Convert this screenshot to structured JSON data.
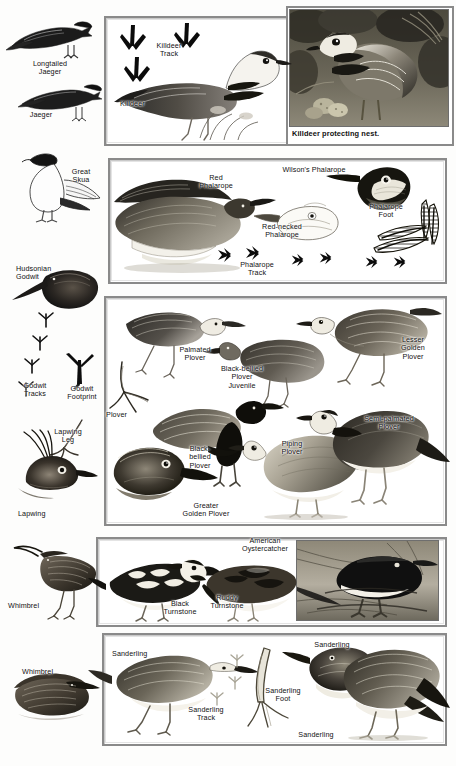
{
  "plate": {
    "title": "Shorebirds identification plate",
    "background_color": "#fdfdfc",
    "panel_border_color": "#8a8a8a",
    "label_color": "#111111"
  },
  "left_column": {
    "labels": [
      {
        "id": "longtailed-jaeger",
        "text": "Longtailed\nJaeger"
      },
      {
        "id": "jaeger",
        "text": "Jaeger"
      },
      {
        "id": "great-skua",
        "text": "Great\nSkua"
      },
      {
        "id": "hudsonian-godwit",
        "text": "Hudsonian\nGodwit"
      },
      {
        "id": "godwit-footprint",
        "text": "Godwit\nFootprint"
      },
      {
        "id": "godwit-tracks",
        "text": "Godwit\nTracks"
      },
      {
        "id": "lapwing-leg",
        "text": "Lapwing\nLeg"
      },
      {
        "id": "lapwing",
        "text": "Lapwing"
      },
      {
        "id": "whimbrel-standing",
        "text": "Whimbrel"
      },
      {
        "id": "whimbrel-sitting",
        "text": "Whimbrel"
      }
    ]
  },
  "panels": [
    {
      "id": "killdeer-panel",
      "labels": [
        {
          "id": "killdeer-track",
          "text": "Killdeer\nTrack"
        },
        {
          "id": "killdeer",
          "text": "Killdeer"
        }
      ]
    },
    {
      "id": "phalarope-panel",
      "labels": [
        {
          "id": "red-phalarope",
          "text": "Red\nPhalarope"
        },
        {
          "id": "wilsons-phalarope",
          "text": "Wilson's Phalarope"
        },
        {
          "id": "red-necked-phalarope",
          "text": "Red-necked\nPhalarope"
        },
        {
          "id": "phalarope-foot",
          "text": "Phalarope\nFoot"
        },
        {
          "id": "phalarope-track",
          "text": "Phalarope\nTrack"
        }
      ]
    },
    {
      "id": "plover-panel",
      "labels": [
        {
          "id": "palmated-plover",
          "text": "Palmated\nPlover"
        },
        {
          "id": "black-bellied-plover-juvenile",
          "text": "Black-bellied\nPlover\nJuvenile"
        },
        {
          "id": "lesser-golden-plover",
          "text": "Lesser\nGolden\nPlover"
        },
        {
          "id": "plover-foot",
          "text": "Plover"
        },
        {
          "id": "black-bellied-plover",
          "text": "Black-\nbellied\nPlover"
        },
        {
          "id": "piping-plover",
          "text": "Piping\nPlover"
        },
        {
          "id": "semi-palmated-plover",
          "text": "Semi-palmated\nPlover"
        },
        {
          "id": "greater-golden-plover",
          "text": "Greater\nGolden Plover"
        }
      ]
    },
    {
      "id": "turnstone-row",
      "labels": [
        {
          "id": "black-turnstone",
          "text": "Black\nTurnstone"
        },
        {
          "id": "ruddy-turnstone",
          "text": "Ruddy\nTurnstone"
        },
        {
          "id": "american-oystercatcher",
          "text": "American\nOystercatcher"
        }
      ]
    },
    {
      "id": "sanderling-panel",
      "labels": [
        {
          "id": "sanderling-left",
          "text": "Sanderling"
        },
        {
          "id": "sanderling-track",
          "text": "Sanderling\nTrack"
        },
        {
          "id": "sanderling-foot",
          "text": "Sanderling\nFoot"
        },
        {
          "id": "sanderling-head",
          "text": "Sanderling"
        },
        {
          "id": "sanderling-right",
          "text": "Sanderling"
        }
      ]
    }
  ],
  "photos": [
    {
      "id": "killdeer-photo",
      "caption": "Killdeer protecting nest."
    },
    {
      "id": "oystercatcher-photo",
      "caption": ""
    }
  ]
}
